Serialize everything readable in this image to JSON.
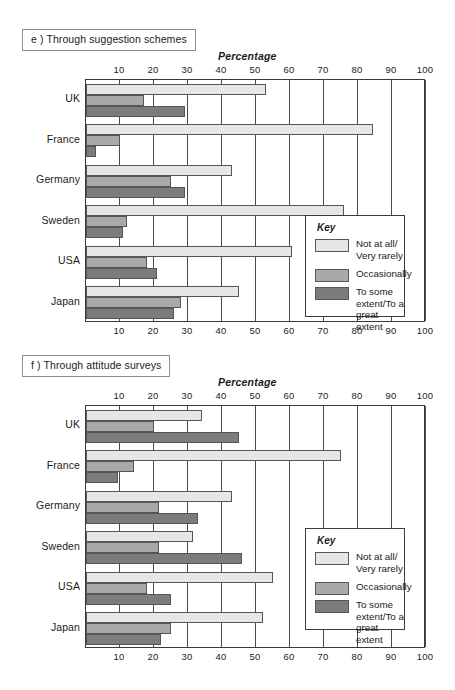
{
  "figure": {
    "panels": [
      {
        "id": "e",
        "title": "e ) Through suggestion schemes",
        "axis_title": "Percentage"
      },
      {
        "id": "f",
        "title": "f ) Through attitude surveys",
        "axis_title": "Percentage"
      }
    ],
    "key": {
      "heading": "Key",
      "entries": [
        {
          "label": "Not at all/\nVery rarely",
          "color": "#e6e6e6"
        },
        {
          "label": "Occasionally",
          "color": "#a9a9a9"
        },
        {
          "label": "To some\nextent/To a\ngreat extent",
          "color": "#7c7c7c"
        }
      ]
    }
  },
  "chart_data": [
    {
      "type": "bar",
      "orientation": "horizontal",
      "title": "e ) Through suggestion schemes",
      "xlabel": "Percentage",
      "ylabel": "",
      "xlim": [
        0,
        100
      ],
      "xticks": [
        10,
        20,
        30,
        40,
        50,
        60,
        70,
        80,
        90,
        100
      ],
      "tick_labels": [
        "10",
        "20",
        "30",
        "40",
        "50",
        "60",
        "70",
        "80",
        "90",
        "100"
      ],
      "grid": true,
      "legend_position": "inside-right",
      "categories": [
        "UK",
        "France",
        "Germany",
        "Sweden",
        "USA",
        "Japan"
      ],
      "series": [
        {
          "name": "Not at all/Very rarely",
          "color": "#e6e6e6",
          "values": [
            53,
            84.5,
            43,
            76,
            60.5,
            45
          ]
        },
        {
          "name": "Occasionally",
          "color": "#a9a9a9",
          "values": [
            17,
            10,
            25,
            12,
            18,
            28
          ]
        },
        {
          "name": "To some extent/To a great extent",
          "color": "#7c7c7c",
          "values": [
            29,
            3,
            29,
            11,
            21,
            26
          ]
        }
      ]
    },
    {
      "type": "bar",
      "orientation": "horizontal",
      "title": "f ) Through attitude surveys",
      "xlabel": "Percentage",
      "ylabel": "",
      "xlim": [
        0,
        100
      ],
      "xticks": [
        10,
        20,
        30,
        40,
        50,
        60,
        70,
        80,
        90,
        100
      ],
      "tick_labels": [
        "10",
        "20",
        "30",
        "40",
        "50",
        "60",
        "70",
        "80",
        "90",
        "100"
      ],
      "grid": true,
      "legend_position": "inside-right",
      "categories": [
        "UK",
        "France",
        "Germany",
        "Sweden",
        "USA",
        "Japan"
      ],
      "series": [
        {
          "name": "Not at all/Very rarely",
          "color": "#e6e6e6",
          "values": [
            34,
            75,
            43,
            31.5,
            55,
            52
          ]
        },
        {
          "name": "Occasionally",
          "color": "#a9a9a9",
          "values": [
            20,
            14,
            21.5,
            21.5,
            18,
            25
          ]
        },
        {
          "name": "To some extent/To a great extent",
          "color": "#7c7c7c",
          "values": [
            45,
            9.5,
            33,
            46,
            25,
            22
          ]
        }
      ]
    }
  ]
}
